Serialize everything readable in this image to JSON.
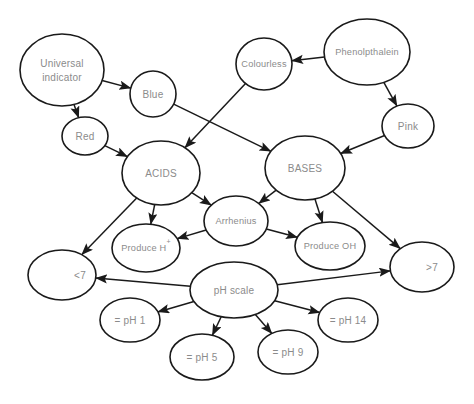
{
  "diagram": {
    "background_color": "#ffffff",
    "stroke_color": "#1a1a1a",
    "label_color": "#8b8b8b",
    "nodes": [
      {
        "id": "universal-indicator",
        "label": "Universal",
        "label2": "indicator",
        "cx": 62,
        "cy": 70,
        "rx": 42,
        "ry": 36
      },
      {
        "id": "blue",
        "label": "Blue",
        "cx": 153,
        "cy": 94,
        "rx": 23,
        "ry": 23
      },
      {
        "id": "red",
        "label": "Red",
        "cx": 85,
        "cy": 136,
        "rx": 23,
        "ry": 19
      },
      {
        "id": "colourless",
        "label": "Colourless",
        "cx": 264,
        "cy": 64,
        "rx": 28,
        "ry": 26
      },
      {
        "id": "phenolpthalein",
        "label": "Phenolpthalein",
        "cx": 367,
        "cy": 52,
        "rx": 43,
        "ry": 33
      },
      {
        "id": "pink",
        "label": "Pink",
        "cx": 408,
        "cy": 126,
        "rx": 26,
        "ry": 22
      },
      {
        "id": "acids",
        "label": "ACIDS",
        "cx": 161,
        "cy": 173,
        "rx": 39,
        "ry": 32
      },
      {
        "id": "bases",
        "label": "BASES",
        "cx": 305,
        "cy": 168,
        "rx": 40,
        "ry": 32
      },
      {
        "id": "arrhenius",
        "label": "Arrhenius",
        "cx": 236,
        "cy": 221,
        "rx": 32,
        "ry": 25
      },
      {
        "id": "produce-h",
        "label": "Produce H",
        "superscript": "+",
        "cx": 146,
        "cy": 248,
        "rx": 34,
        "ry": 24
      },
      {
        "id": "produce-oh",
        "label": "Produce OH",
        "cx": 330,
        "cy": 246,
        "rx": 35,
        "ry": 24
      },
      {
        "id": "less-than-7",
        "label": "<7",
        "cx": 62,
        "cy": 275,
        "rx": 34,
        "ry": 25,
        "label_dx": 18
      },
      {
        "id": "greater-than-7",
        "label": ">7",
        "cx": 422,
        "cy": 267,
        "rx": 32,
        "ry": 25,
        "label_dx": 10
      },
      {
        "id": "ph-scale",
        "label": "pH scale",
        "cx": 234,
        "cy": 290,
        "rx": 44,
        "ry": 28
      },
      {
        "id": "ph-1",
        "label": "= pH 1",
        "cx": 130,
        "cy": 320,
        "rx": 30,
        "ry": 22
      },
      {
        "id": "ph-5",
        "label": "= pH 5",
        "cx": 202,
        "cy": 357,
        "rx": 32,
        "ry": 23
      },
      {
        "id": "ph-9",
        "label": "= pH 9",
        "cx": 288,
        "cy": 352,
        "rx": 30,
        "ry": 22
      },
      {
        "id": "ph-14",
        "label": "= pH 14",
        "cx": 348,
        "cy": 320,
        "rx": 30,
        "ry": 22
      }
    ],
    "edges": [
      {
        "from": "universal-indicator",
        "to": "blue"
      },
      {
        "from": "universal-indicator",
        "to": "red"
      },
      {
        "from": "red",
        "to": "acids"
      },
      {
        "from": "blue",
        "to": "bases"
      },
      {
        "from": "colourless",
        "to": "acids"
      },
      {
        "from": "phenolpthalein",
        "to": "colourless"
      },
      {
        "from": "phenolpthalein",
        "to": "pink"
      },
      {
        "from": "pink",
        "to": "bases"
      },
      {
        "from": "acids",
        "to": "arrhenius"
      },
      {
        "from": "bases",
        "to": "arrhenius"
      },
      {
        "from": "acids",
        "to": "produce-h"
      },
      {
        "from": "bases",
        "to": "produce-oh"
      },
      {
        "from": "arrhenius",
        "to": "produce-h"
      },
      {
        "from": "arrhenius",
        "to": "produce-oh"
      },
      {
        "from": "acids",
        "to": "less-than-7"
      },
      {
        "from": "bases",
        "to": "greater-than-7"
      },
      {
        "from": "ph-scale",
        "to": "less-than-7"
      },
      {
        "from": "ph-scale",
        "to": "greater-than-7"
      },
      {
        "from": "ph-scale",
        "to": "ph-1"
      },
      {
        "from": "ph-scale",
        "to": "ph-5"
      },
      {
        "from": "ph-scale",
        "to": "ph-9"
      },
      {
        "from": "ph-scale",
        "to": "ph-14"
      }
    ]
  }
}
